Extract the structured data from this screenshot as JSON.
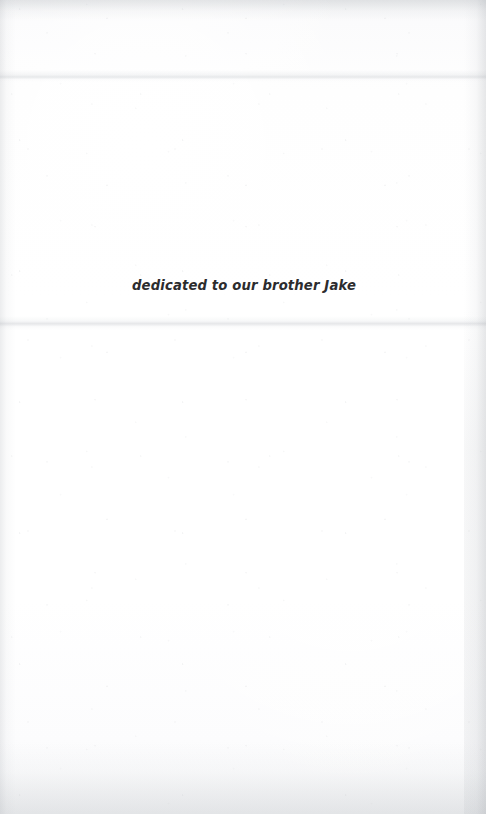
{
  "page": {
    "kind": "book-dedication-page",
    "background_color": "#fdfdfd",
    "width": 486,
    "height": 814
  },
  "dedication": {
    "text": "dedicated to our brother Jake",
    "color": "#2c2c2e",
    "style": "italic"
  },
  "artifacts": {
    "crease_upper_label": "",
    "crease_lower_label": "",
    "edge_shadow_left_label": "",
    "edge_shadow_right_label": "",
    "edge_shadow_top_label": "",
    "edge_shadow_bottom_label": "",
    "grain_label": ""
  }
}
